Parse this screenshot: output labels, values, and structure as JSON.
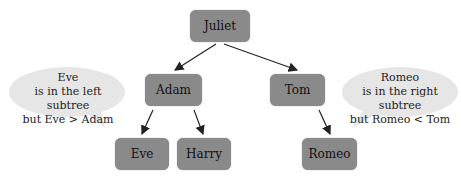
{
  "nodes": {
    "juliet": "Juliet",
    "adam": "Adam",
    "tom": "Tom",
    "eve": "Eve",
    "harry": "Harry",
    "romeo": "Romeo"
  },
  "bubbles": {
    "left": [
      "Eve",
      "is in the left subtree",
      "but Eve > Adam"
    ],
    "right": [
      "Romeo",
      "is in the right subtree",
      "but Romeo < Tom"
    ]
  },
  "colors": {
    "node": "#8a8a8a",
    "bubble": "#e6e6e6",
    "arrow": "#222222"
  }
}
